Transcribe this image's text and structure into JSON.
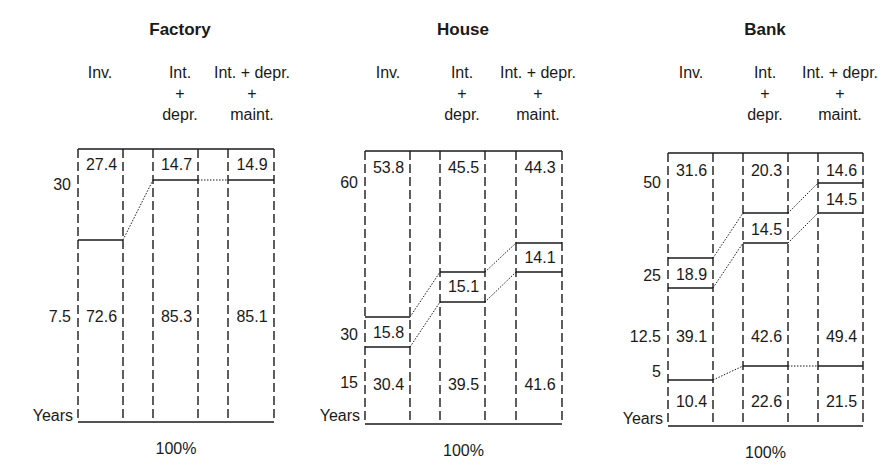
{
  "chart_data": [
    {
      "type": "table",
      "title": "Factory",
      "xlabel": "100%",
      "ylabel": "Years",
      "columns": [
        "Inv.",
        "Int. + depr.",
        "Int. + depr. + maint."
      ],
      "y_ticks": [
        "30",
        "7.5"
      ],
      "segments": [
        [
          "27.4",
          "72.6"
        ],
        [
          "14.7",
          "85.3"
        ],
        [
          "14.9",
          "85.1"
        ]
      ]
    },
    {
      "type": "table",
      "title": "House",
      "xlabel": "100%",
      "ylabel": "Years",
      "columns": [
        "Inv.",
        "Int. + depr.",
        "Int. + depr. + maint."
      ],
      "y_ticks": [
        "60",
        "30",
        "15"
      ],
      "segments": [
        [
          "53.8",
          "15.8",
          "30.4"
        ],
        [
          "45.5",
          "15.1",
          "39.5"
        ],
        [
          "44.3",
          "14.1",
          "41.6"
        ]
      ]
    },
    {
      "type": "table",
      "title": "Bank",
      "xlabel": "100%",
      "ylabel": "Years",
      "columns": [
        "Inv.",
        "Int. + depr.",
        "Int. + depr. + maint."
      ],
      "y_ticks": [
        "50",
        "25",
        "12.5",
        "5"
      ],
      "segments": [
        [
          "31.6",
          "18.9",
          "39.1",
          "10.4"
        ],
        [
          "20.3",
          "14.5",
          "42.6",
          "22.6"
        ],
        [
          "14.6",
          "14.5",
          "49.4",
          "21.5"
        ]
      ]
    }
  ],
  "panels": [
    {
      "title": "Factory",
      "title_x": 180,
      "headers": [
        {
          "lines": [
            "Inv."
          ],
          "x": 100
        },
        {
          "lines": [
            "Int.",
            "+",
            "depr."
          ],
          "x": 180
        },
        {
          "lines": [
            "Int. + depr.",
            "+",
            "maint."
          ],
          "x": 252
        }
      ],
      "xs": [
        78,
        123,
        153,
        198,
        228,
        274
      ],
      "top": 149,
      "bottom": 422,
      "ylabel": "Years",
      "ylabel_y": 421,
      "xlabel": "100%",
      "ticks": [
        {
          "label": "30",
          "y": 190
        },
        {
          "label": "7.5",
          "y": 322
        }
      ],
      "hlines": [
        [
          240
        ],
        [
          180
        ],
        [
          180
        ]
      ],
      "connectors": [
        [
          [
            240,
            180
          ]
        ],
        [
          [
            180,
            180
          ]
        ]
      ],
      "values": [
        [
          {
            "v": "27.4",
            "y": 170
          },
          {
            "v": "72.6",
            "y": 322
          }
        ],
        [
          {
            "v": "14.7",
            "y": 170
          },
          {
            "v": "85.3",
            "y": 322
          }
        ],
        [
          {
            "v": "14.9",
            "y": 170
          },
          {
            "v": "85.1",
            "y": 322
          }
        ]
      ]
    },
    {
      "title": "House",
      "title_x": 463,
      "headers": [
        {
          "lines": [
            "Inv."
          ],
          "x": 388
        },
        {
          "lines": [
            "Int.",
            "+",
            "depr."
          ],
          "x": 462
        },
        {
          "lines": [
            "Int. + depr.",
            "+",
            "maint."
          ],
          "x": 538
        }
      ],
      "xs": [
        365,
        410,
        440,
        485,
        516,
        562
      ],
      "top": 151,
      "bottom": 424,
      "ylabel": "Years",
      "ylabel_y": 421,
      "xlabel": "100%",
      "ticks": [
        {
          "label": "60",
          "y": 188
        },
        {
          "label": "30",
          "y": 340
        },
        {
          "label": "15",
          "y": 388
        }
      ],
      "hlines": [
        [
          317,
          347
        ],
        [
          272,
          302
        ],
        [
          243,
          272
        ]
      ],
      "connectors": [
        [
          [
            317,
            272
          ],
          [
            347,
            302
          ]
        ],
        [
          [
            272,
            243
          ],
          [
            302,
            272
          ]
        ]
      ],
      "values": [
        [
          {
            "v": "53.8",
            "y": 173
          },
          {
            "v": "15.8",
            "y": 338
          },
          {
            "v": "30.4",
            "y": 390
          }
        ],
        [
          {
            "v": "45.5",
            "y": 173
          },
          {
            "v": "15.1",
            "y": 292
          },
          {
            "v": "39.5",
            "y": 390
          }
        ],
        [
          {
            "v": "44.3",
            "y": 173
          },
          {
            "v": "14.1",
            "y": 263
          },
          {
            "v": "41.6",
            "y": 390
          }
        ]
      ]
    },
    {
      "title": "Bank",
      "title_x": 765,
      "headers": [
        {
          "lines": [
            "Inv."
          ],
          "x": 691
        },
        {
          "lines": [
            "Int.",
            "+",
            "depr."
          ],
          "x": 765
        },
        {
          "lines": [
            "Int. + depr.",
            "+",
            "maint."
          ],
          "x": 840
        }
      ],
      "xs": [
        668,
        713,
        743,
        788,
        818,
        863
      ],
      "top": 153,
      "bottom": 426,
      "ylabel": "Years",
      "ylabel_y": 424,
      "xlabel": "100%",
      "ticks": [
        {
          "label": "50",
          "y": 188
        },
        {
          "label": "25",
          "y": 281
        },
        {
          "label": "12.5",
          "y": 342
        },
        {
          "label": "5",
          "y": 377
        }
      ],
      "hlines": [
        [
          258,
          288,
          380
        ],
        [
          213,
          243,
          366
        ],
        [
          183,
          213,
          366
        ]
      ],
      "connectors": [
        [
          [
            258,
            213
          ],
          [
            288,
            243
          ],
          [
            380,
            366
          ]
        ],
        [
          [
            213,
            183
          ],
          [
            243,
            213
          ],
          [
            366,
            366
          ]
        ]
      ],
      "values": [
        [
          {
            "v": "31.6",
            "y": 176
          },
          {
            "v": "18.9",
            "y": 280
          },
          {
            "v": "39.1",
            "y": 342
          },
          {
            "v": "10.4",
            "y": 407
          }
        ],
        [
          {
            "v": "20.3",
            "y": 176
          },
          {
            "v": "14.5",
            "y": 235
          },
          {
            "v": "42.6",
            "y": 342
          },
          {
            "v": "22.6",
            "y": 407
          }
        ],
        [
          {
            "v": "14.6",
            "y": 176
          },
          {
            "v": "14.5",
            "y": 205
          },
          {
            "v": "49.4",
            "y": 342
          },
          {
            "v": "21.5",
            "y": 407
          }
        ]
      ]
    }
  ]
}
